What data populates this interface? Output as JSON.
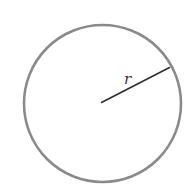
{
  "figure": {
    "type": "circle-radius-diagram",
    "shape": "circle",
    "radius_label": "r",
    "colors": {
      "background": "#ffffff",
      "circle_stroke": "#8a8a8a",
      "radius_line": "#2e2e2e",
      "label": "#333333"
    }
  }
}
